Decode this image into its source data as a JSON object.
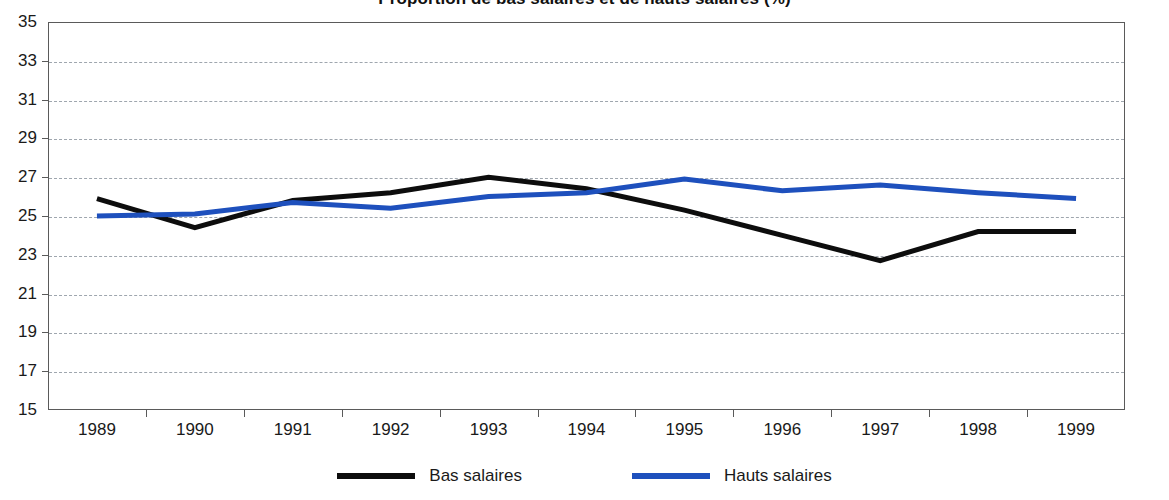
{
  "chart_data": {
    "type": "line",
    "title": "Proportion de bas salaires et de hauts salaires (%)",
    "xlabel": "",
    "ylabel": "",
    "categories": [
      "1989",
      "1990",
      "1991",
      "1992",
      "1993",
      "1994",
      "1995",
      "1996",
      "1997",
      "1998",
      "1999"
    ],
    "ylim": [
      15,
      35
    ],
    "ytick_step": 2,
    "yticks": [
      35,
      33,
      31,
      29,
      27,
      25,
      23,
      21,
      19,
      17,
      15
    ],
    "grid": true,
    "legend_position": "bottom",
    "series": [
      {
        "name": "Bas salaires",
        "color": "#0d0d0d",
        "values": [
          25.9,
          24.4,
          25.8,
          26.2,
          27.0,
          26.4,
          25.3,
          24.0,
          22.7,
          24.2,
          24.2
        ]
      },
      {
        "name": "Hauts salaires",
        "color": "#1e50bd",
        "values": [
          25.0,
          25.1,
          25.7,
          25.4,
          26.0,
          26.2,
          26.9,
          26.3,
          26.6,
          26.2,
          25.9
        ]
      }
    ]
  },
  "legend": {
    "entries": [
      {
        "label": "Bas salaires",
        "color": "#0d0d0d"
      },
      {
        "label": "Hauts salaires",
        "color": "#1e50bd"
      }
    ]
  }
}
